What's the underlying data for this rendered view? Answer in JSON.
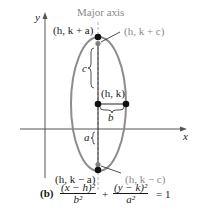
{
  "diagram": {
    "major_axis_label": "Major axis",
    "axis_labels": {
      "x": "x",
      "y": "y"
    },
    "points": {
      "top_vertex": "(h, k + a)",
      "top_focus": "(h, k + c)",
      "center": "(h, k)",
      "bottom_vertex": "(h, k − a)",
      "bottom_focus": "(h, k − c)"
    },
    "distance_labels": {
      "c": "c",
      "b": "b",
      "a": "a"
    },
    "colors": {
      "ellipse": "#8c8c8c",
      "axis": "#555555",
      "vertex": "#111111",
      "focus": "#808080",
      "gray_label": "#8a8a8a"
    }
  },
  "caption": {
    "part": "(b)",
    "term1_num": "(x − h)²",
    "term1_den": "b²",
    "plus": "+",
    "term2_num": "(y − k)²",
    "term2_den": "a²",
    "equals": "= 1"
  }
}
